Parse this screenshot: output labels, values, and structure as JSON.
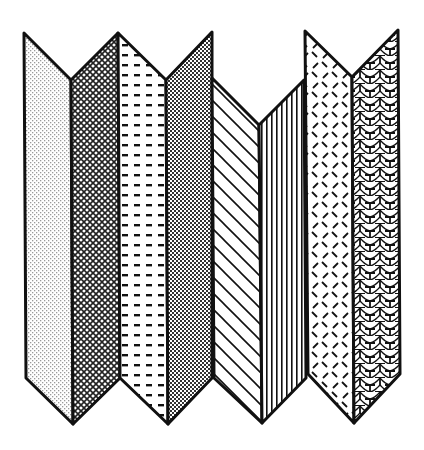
{
  "illustration": {
    "title": "Folding screen with patterned panels",
    "background": "#ffffff",
    "stroke_color": "#111111",
    "panels": [
      {
        "id": "panel-1",
        "pattern": "fine-dot-stipple",
        "points": "24,33 71,80 73,424 26,378"
      },
      {
        "id": "panel-2",
        "pattern": "diamond-crosshatch",
        "points": "71,80 118,33 120,378 73,424"
      },
      {
        "id": "panel-3",
        "pattern": "horizontal-dashes",
        "points": "118,33 166,80 168,424 120,378"
      },
      {
        "id": "panel-4",
        "pattern": "checker-dense",
        "points": "166,80 212,32 212,378 168,424"
      },
      {
        "id": "panel-5",
        "pattern": "diagonal-lines",
        "points": "212,78 259,125 262,423 214,378"
      },
      {
        "id": "panel-6",
        "pattern": "vertical-lines",
        "points": "259,125 304,80 306,378 262,423"
      },
      {
        "id": "panel-7",
        "pattern": "diagonal-dashes",
        "points": "305,31 352,77 354,423 308,374"
      },
      {
        "id": "panel-8",
        "pattern": "fish-scales",
        "points": "352,77 398,30 400,374 354,423"
      }
    ]
  }
}
